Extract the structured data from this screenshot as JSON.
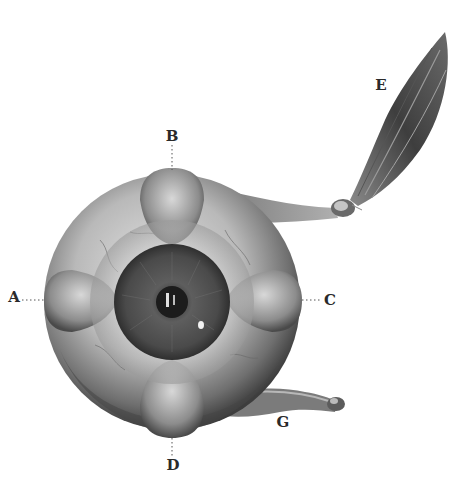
{
  "figure": {
    "labels": {
      "A": "A",
      "B": "B",
      "C": "C",
      "D": "D",
      "E": "E",
      "G": "G"
    }
  }
}
